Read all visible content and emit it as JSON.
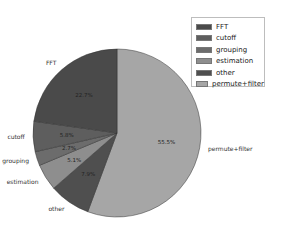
{
  "chart_data": {
    "type": "pie",
    "title": "",
    "categories": [
      "permute+filter",
      "other",
      "estimation",
      "grouping",
      "cutoff",
      "FFT"
    ],
    "values": [
      55.5,
      7.9,
      5.1,
      2.7,
      5.8,
      22.7
    ],
    "value_labels": [
      "55.5%",
      "7.9%",
      "5.1%",
      "2.7%",
      "5.8%",
      "22.7%"
    ],
    "colors": [
      "#a6a6a6",
      "#4f4f4f",
      "#8e8e8e",
      "#6c6c6c",
      "#5e5e5e",
      "#4a4a4a"
    ],
    "start_angle_deg": 90,
    "direction": "clockwise",
    "legend": {
      "position": "upper right",
      "entries": [
        {
          "label": "FFT",
          "color": "#4a4a4a"
        },
        {
          "label": "cutoff",
          "color": "#5e5e5e"
        },
        {
          "label": "grouping",
          "color": "#6c6c6c"
        },
        {
          "label": "estimation",
          "color": "#8e8e8e"
        },
        {
          "label": "other",
          "color": "#4f4f4f"
        },
        {
          "label": "permute+filter",
          "color": "#a6a6a6"
        }
      ]
    }
  }
}
